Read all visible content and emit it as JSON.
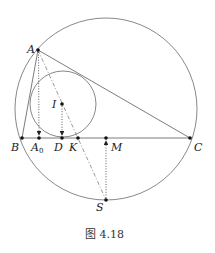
{
  "caption": "图 4.18",
  "colors": {
    "stroke": "#444444",
    "point": "#111111"
  },
  "points": {
    "A": {
      "label": "A",
      "x": 38,
      "y": 50
    },
    "B": {
      "label": "B",
      "x": 22,
      "y": 138
    },
    "C": {
      "label": "C",
      "x": 190,
      "y": 138
    },
    "I": {
      "label": "I",
      "x": 62,
      "y": 104
    },
    "A0": {
      "label": "A",
      "sub": "0",
      "x": 39,
      "y": 138
    },
    "D": {
      "label": "D",
      "x": 62,
      "y": 138
    },
    "K": {
      "label": "K",
      "x": 78,
      "y": 138
    },
    "M": {
      "label": "M",
      "x": 106,
      "y": 138
    },
    "S": {
      "label": "S",
      "x": 106,
      "y": 200
    }
  },
  "circles": {
    "circumcircle": {
      "cx": 106,
      "cy": 109,
      "r": 91
    },
    "incircle": {
      "cx": 63,
      "cy": 104,
      "r": 33
    }
  }
}
